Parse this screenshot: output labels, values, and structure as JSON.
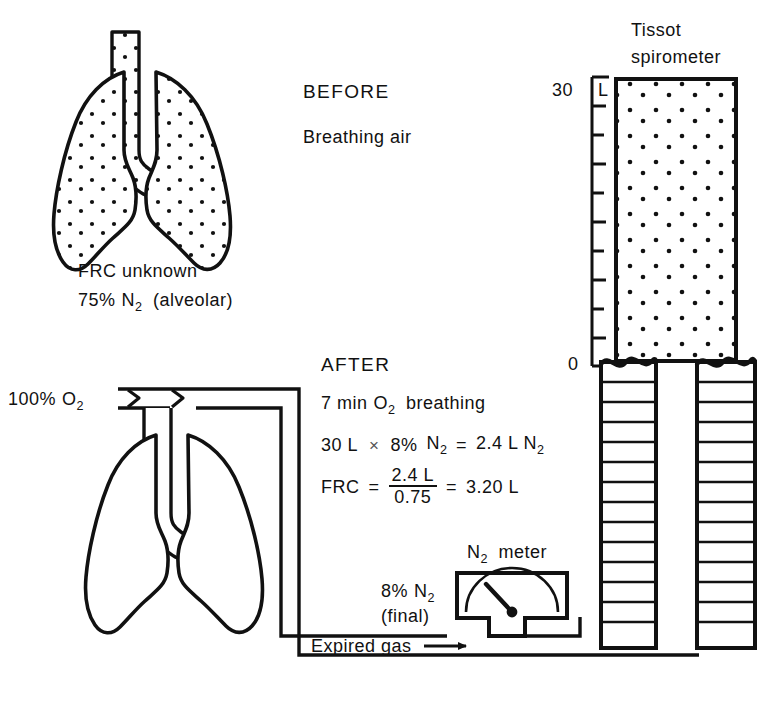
{
  "figure": {
    "title_semantic": "frc-nitrogen-washout-diagram",
    "ink_color": "#111111",
    "background_color": "#ffffff"
  },
  "before_panel": {
    "heading": "BEFORE",
    "subheading": "Breathing air",
    "lung_caption_line1": "FRC unknown",
    "lung_caption_line2_pre": "75%",
    "lung_caption_line2_gas": "N",
    "lung_caption_line2_sub": "2",
    "lung_caption_line2_post": "(alveolar)"
  },
  "after_panel": {
    "heading": "AFTER",
    "oxygen_source_pre": "100%",
    "oxygen_source_gas": "O",
    "oxygen_source_sub": "2",
    "line1_pre": "7 min",
    "line1_gas": "O",
    "line1_sub": "2",
    "line1_post": "breathing",
    "equation1": {
      "volume": "30 L",
      "times": "×",
      "percent": "8%",
      "gas": "N",
      "gas_sub": "2",
      "equals": "=",
      "result": "2.4 L N",
      "result_sub": "2"
    },
    "equation2": {
      "label": "FRC",
      "equals1": "=",
      "numerator": "2.4 L",
      "denominator": "0.75",
      "equals2": "=",
      "result": "3.20 L"
    }
  },
  "n2_meter": {
    "label_gas": "N",
    "label_sub": "2",
    "label_word": "meter",
    "reading_percent": "8%",
    "reading_gas": "N",
    "reading_sub": "2",
    "reading_state": "(final)"
  },
  "spirometer": {
    "title_line1": "Tissot",
    "title_line2": "spirometer",
    "scale_top_value": "30",
    "scale_top_unit": "L",
    "scale_bottom_value": "0",
    "scale_tick_count": 10
  },
  "flow": {
    "expired_gas_label": "Expired gas",
    "arrow_glyph": "→"
  }
}
